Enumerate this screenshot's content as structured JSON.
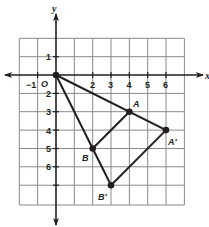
{
  "axes": {
    "x_label": "x",
    "y_label": "y",
    "origin_label": "O",
    "x_ticks": [
      "−1",
      "2",
      "3",
      "4",
      "5",
      "6"
    ],
    "y_ticks": [
      "1",
      "2",
      "3",
      "4",
      "5",
      "6"
    ],
    "x_range": [
      -2,
      7
    ],
    "y_range": [
      -7,
      2
    ]
  },
  "points": {
    "O": {
      "label": "O",
      "x": 0,
      "y": 0
    },
    "A": {
      "label": "A",
      "x": 4,
      "y": -2
    },
    "B": {
      "label": "B",
      "x": 2,
      "y": -4
    },
    "A_prime": {
      "label": "A′",
      "x": 6,
      "y": -3
    },
    "B_prime": {
      "label": "B′",
      "x": 3,
      "y": -6
    }
  },
  "segments": [
    [
      "O",
      "A_prime"
    ],
    [
      "O",
      "B_prime"
    ],
    [
      "A",
      "B"
    ],
    [
      "A_prime",
      "B_prime"
    ]
  ],
  "colors": {
    "grid": "#8a8a8a",
    "line": "#231f20",
    "background": "#ffffff"
  }
}
